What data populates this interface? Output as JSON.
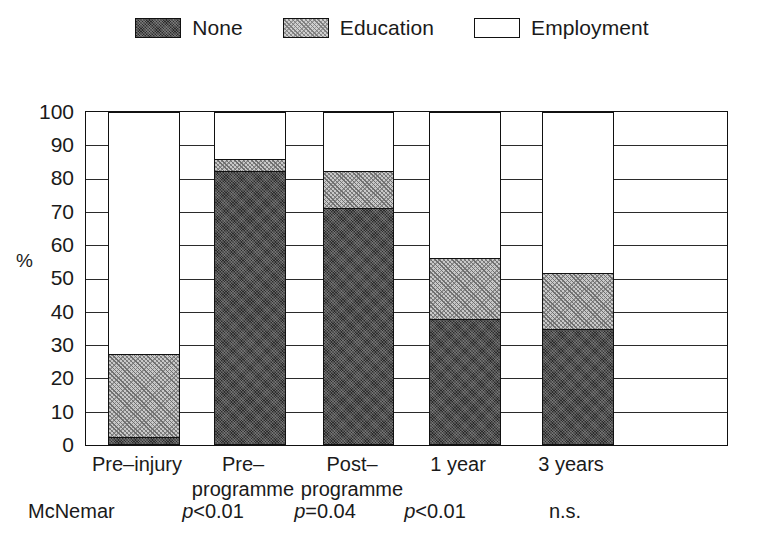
{
  "legend": {
    "items": [
      {
        "key": "none",
        "label": "None",
        "swatch": "dark-stipple-swatch"
      },
      {
        "key": "education",
        "label": "Education",
        "swatch": "hatch-swatch"
      },
      {
        "key": "employment",
        "label": "Employment",
        "swatch": "white-swatch"
      }
    ]
  },
  "axis": {
    "ylabel": "%",
    "yticks": [
      "100",
      "90",
      "80",
      "70",
      "60",
      "50",
      "40",
      "30",
      "20",
      "10",
      "0"
    ]
  },
  "xlabels": [
    {
      "line1": "Pre–injury",
      "line2": ""
    },
    {
      "line1": "Pre–",
      "line2": "programme"
    },
    {
      "line1": "Post–",
      "line2": "programme"
    },
    {
      "line1": "1 year",
      "line2": ""
    },
    {
      "line1": "3 years",
      "line2": ""
    }
  ],
  "stats": {
    "row_label": "McNemar",
    "values": [
      "p<0.01",
      "p=0.04",
      "p<0.01",
      "n.s."
    ],
    "italic_prefix": "p"
  },
  "chart_data": {
    "type": "bar",
    "title": "",
    "xlabel": "",
    "ylabel": "%",
    "ylim": [
      0,
      100
    ],
    "yticks": [
      0,
      10,
      20,
      30,
      40,
      50,
      60,
      70,
      80,
      90,
      100
    ],
    "grid": true,
    "stacked": true,
    "legend_position": "top-center",
    "categories": [
      "Pre–injury",
      "Pre–programme",
      "Post–programme",
      "1 year",
      "3 years"
    ],
    "series": [
      {
        "name": "None",
        "values": [
          2,
          82,
          71,
          37.5,
          34.5
        ]
      },
      {
        "name": "Education",
        "values": [
          25,
          3.5,
          11,
          18.5,
          17
        ]
      },
      {
        "name": "Employment",
        "values": [
          73,
          14.5,
          18,
          44,
          48.5
        ]
      }
    ],
    "cumulative_tops": {
      "none": [
        2,
        82,
        71,
        37.5,
        34.5
      ],
      "education": [
        27,
        85.5,
        82,
        56,
        51.5
      ],
      "employment": [
        100,
        100,
        100,
        100,
        100
      ]
    },
    "annotations": [
      "McNemar",
      "p<0.01",
      "p=0.04",
      "p<0.01",
      "n.s."
    ]
  }
}
